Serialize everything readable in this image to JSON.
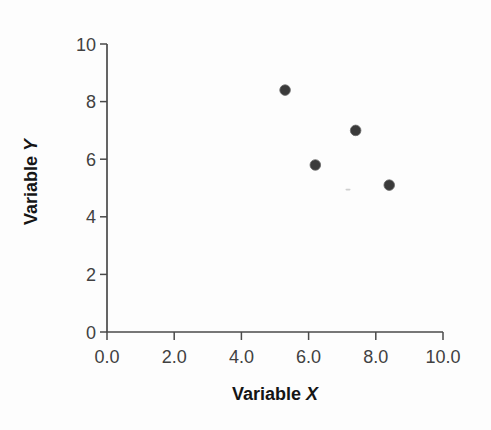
{
  "figure": {
    "width_px": 491,
    "height_px": 430,
    "background_color": "#fdfdfd"
  },
  "chart_data": {
    "type": "scatter",
    "title": "",
    "xlabel": "Variable X",
    "xlabel_text": "Variable",
    "xlabel_symbol": "X",
    "ylabel": "Variable Y",
    "ylabel_text": "Variable",
    "ylabel_symbol": "Y",
    "xlim": [
      0,
      10
    ],
    "ylim": [
      0,
      10
    ],
    "xtick_values": [
      0,
      2,
      4,
      6,
      8,
      10
    ],
    "xtick_labels": [
      "0.0",
      "2.0",
      "4.0",
      "6.0",
      "8.0",
      "10.0"
    ],
    "ytick_values": [
      0,
      2,
      4,
      6,
      8,
      10
    ],
    "ytick_labels": [
      "0",
      "2",
      "4",
      "6",
      "8",
      "10"
    ],
    "grid": false,
    "legend": null,
    "points": [
      {
        "x": 5.3,
        "y": 8.4
      },
      {
        "x": 6.2,
        "y": 5.8
      },
      {
        "x": 7.4,
        "y": 7.0
      },
      {
        "x": 8.4,
        "y": 5.1
      }
    ],
    "marker": {
      "shape": "circle",
      "radius_px": 5.3,
      "color": "#3a3a3a",
      "edge_color": "#6a6a6a"
    },
    "axis_color": "#4a4a4a",
    "tick_label_color": "#414141",
    "axis_label_color": "#151515",
    "tick_label_font_px": 18,
    "axis_label_font_px": 18
  }
}
